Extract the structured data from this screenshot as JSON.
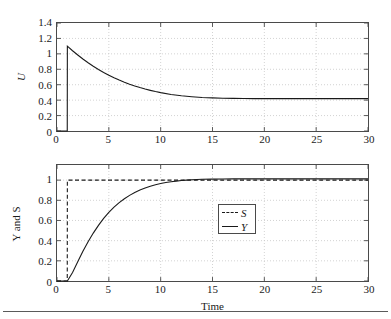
{
  "figure": {
    "background": "#ffffff",
    "axis_color": "#4a4a4a",
    "grid_color": "#c8c8c8",
    "curve_color": "#1a1a1a"
  },
  "chart_data": [
    {
      "type": "line",
      "id": "control-signal-u",
      "title": "",
      "xlabel": "",
      "ylabel": "U",
      "xlim": [
        0,
        30
      ],
      "ylim": [
        0,
        1.4
      ],
      "xticks": [
        0,
        5,
        10,
        15,
        20,
        25,
        30
      ],
      "yticks": [
        0,
        0.2,
        0.4,
        0.6,
        0.8,
        1,
        1.2,
        1.4
      ],
      "ytick_labels": [
        "0",
        "0.2",
        "0.4",
        "0.6",
        "0.8",
        "1",
        "1.2",
        "1.4"
      ],
      "xtick_labels": [
        "0",
        "5",
        "10",
        "15",
        "20",
        "25",
        "30"
      ],
      "grid": true,
      "grid_style": "dotted",
      "legend": null,
      "series": [
        {
          "name": "U",
          "style": "solid",
          "description": "step at t=1 to 1.10 then exponential decay to steady state 0.42",
          "x": [
            0,
            0.99,
            1,
            1.5,
            2,
            2.5,
            3,
            3.5,
            4,
            4.5,
            5,
            5.5,
            6,
            6.5,
            7,
            7.5,
            8,
            8.5,
            9,
            9.5,
            10,
            11,
            12,
            13,
            14,
            15,
            16,
            17,
            18,
            19,
            20,
            22,
            24,
            26,
            28,
            30
          ],
          "y": [
            0,
            0,
            1.1,
            1.04,
            0.985,
            0.933,
            0.885,
            0.84,
            0.798,
            0.759,
            0.723,
            0.69,
            0.66,
            0.632,
            0.607,
            0.584,
            0.563,
            0.544,
            0.527,
            0.511,
            0.497,
            0.474,
            0.456,
            0.444,
            0.435,
            0.429,
            0.425,
            0.423,
            0.421,
            0.42,
            0.42,
            0.42,
            0.42,
            0.42,
            0.42,
            0.42
          ]
        }
      ]
    },
    {
      "type": "line",
      "id": "output-and-setpoint",
      "title": "",
      "xlabel": "Time",
      "ylabel": "Y and S",
      "xlim": [
        0,
        30
      ],
      "ylim": [
        0,
        1.15
      ],
      "xticks": [
        0,
        5,
        10,
        15,
        20,
        25,
        30
      ],
      "yticks": [
        0,
        0.2,
        0.4,
        0.6,
        0.8,
        1
      ],
      "ytick_labels": [
        "0",
        "0.2",
        "0.4",
        "0.6",
        "0.8",
        "1"
      ],
      "xtick_labels": [
        "0",
        "5",
        "10",
        "15",
        "20",
        "25",
        "30"
      ],
      "grid": true,
      "grid_style": "dotted",
      "legend": {
        "position": "center",
        "entries": [
          {
            "label": "S",
            "style": "dashed"
          },
          {
            "label": "Y",
            "style": "solid"
          }
        ]
      },
      "series": [
        {
          "name": "S",
          "style": "dashed",
          "description": "unit step setpoint at t=1",
          "x": [
            0,
            0.99,
            1,
            30
          ],
          "y": [
            0,
            0,
            1.0,
            1.0
          ]
        },
        {
          "name": "Y",
          "style": "solid",
          "description": "first-order-like rise from t=1 settling at 1.01",
          "x": [
            0,
            1,
            1.5,
            2,
            2.5,
            3,
            3.5,
            4,
            4.5,
            5,
            5.5,
            6,
            6.5,
            7,
            7.5,
            8,
            8.5,
            9,
            9.5,
            10,
            10.5,
            11,
            11.5,
            12,
            12.5,
            13,
            14,
            15,
            16,
            17,
            18,
            20,
            22,
            24,
            26,
            28,
            30
          ],
          "y": [
            0,
            0,
            0.085,
            0.19,
            0.295,
            0.39,
            0.475,
            0.552,
            0.62,
            0.68,
            0.732,
            0.777,
            0.816,
            0.849,
            0.878,
            0.902,
            0.922,
            0.94,
            0.954,
            0.966,
            0.976,
            0.984,
            0.99,
            0.996,
            1.0,
            1.003,
            1.008,
            1.01,
            1.011,
            1.012,
            1.012,
            1.012,
            1.012,
            1.012,
            1.012,
            1.012,
            1.012
          ]
        }
      ]
    }
  ]
}
